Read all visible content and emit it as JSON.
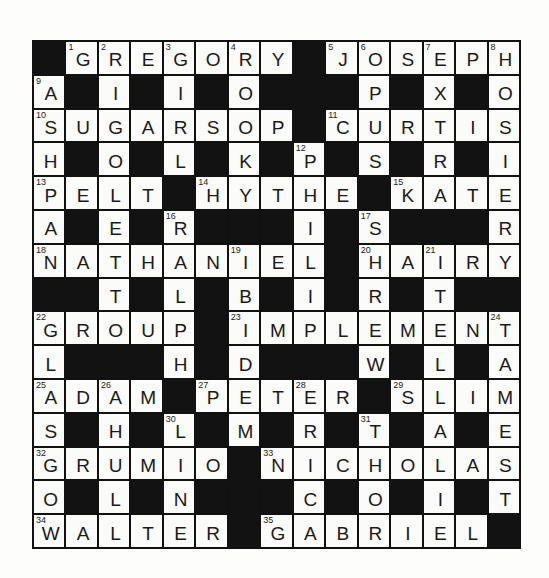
{
  "puzzle": {
    "rows": 15,
    "cols": 15,
    "colors": {
      "block": "#121212",
      "cell": "#fbfbf9",
      "line": "#111111",
      "text": "#1a1a1a"
    },
    "grid": [
      [
        "#",
        "G",
        "R",
        "E",
        "G",
        "O",
        "R",
        "Y",
        "#",
        "J",
        "O",
        "S",
        "E",
        "P",
        "H"
      ],
      [
        "A",
        "#",
        "I",
        "#",
        "I",
        "#",
        "O",
        "#",
        "#",
        "#",
        "P",
        "#",
        "X",
        "#",
        "O"
      ],
      [
        "S",
        "U",
        "G",
        "A",
        "R",
        "S",
        "O",
        "P",
        "#",
        "C",
        "U",
        "R",
        "T",
        "I",
        "S"
      ],
      [
        "H",
        "#",
        "O",
        "#",
        "L",
        "#",
        "K",
        "#",
        "P",
        "#",
        "S",
        "#",
        "R",
        "#",
        "I"
      ],
      [
        "P",
        "E",
        "L",
        "T",
        "#",
        "H",
        "Y",
        "T",
        "H",
        "E",
        "#",
        "K",
        "A",
        "T",
        "E"
      ],
      [
        "A",
        "#",
        "E",
        "#",
        "R",
        "#",
        "#",
        "#",
        "I",
        "#",
        "S",
        "#",
        "#",
        "#",
        "R"
      ],
      [
        "N",
        "A",
        "T",
        "H",
        "A",
        "N",
        "I",
        "E",
        "L",
        "#",
        "H",
        "A",
        "I",
        "R",
        "Y"
      ],
      [
        "#",
        "#",
        "T",
        "#",
        "L",
        "#",
        "B",
        "#",
        "I",
        "#",
        "R",
        "#",
        "T",
        "#",
        "#"
      ],
      [
        "G",
        "R",
        "O",
        "U",
        "P",
        "#",
        "I",
        "M",
        "P",
        "L",
        "E",
        "M",
        "E",
        "N",
        "T"
      ],
      [
        "L",
        "#",
        "#",
        "#",
        "H",
        "#",
        "D",
        "#",
        "#",
        "#",
        "W",
        "#",
        "L",
        "#",
        "A"
      ],
      [
        "A",
        "D",
        "A",
        "M",
        "#",
        "P",
        "E",
        "T",
        "E",
        "R",
        "#",
        "S",
        "L",
        "I",
        "M"
      ],
      [
        "S",
        "#",
        "H",
        "#",
        "L",
        "#",
        "M",
        "#",
        "R",
        "#",
        "T",
        "#",
        "A",
        "#",
        "E"
      ],
      [
        "G",
        "R",
        "U",
        "M",
        "I",
        "O",
        "#",
        "N",
        "I",
        "C",
        "H",
        "O",
        "L",
        "A",
        "S"
      ],
      [
        "O",
        "#",
        "L",
        "#",
        "N",
        "#",
        "#",
        "#",
        "C",
        "#",
        "O",
        "#",
        "I",
        "#",
        "T"
      ],
      [
        "W",
        "A",
        "L",
        "T",
        "E",
        "R",
        "#",
        "G",
        "A",
        "B",
        "R",
        "I",
        "E",
        "L",
        "#"
      ]
    ],
    "numbers": [
      {
        "n": 1,
        "r": 0,
        "c": 1
      },
      {
        "n": 2,
        "r": 0,
        "c": 2
      },
      {
        "n": 3,
        "r": 0,
        "c": 4
      },
      {
        "n": 4,
        "r": 0,
        "c": 6
      },
      {
        "n": 5,
        "r": 0,
        "c": 9
      },
      {
        "n": 6,
        "r": 0,
        "c": 10
      },
      {
        "n": 7,
        "r": 0,
        "c": 12
      },
      {
        "n": 8,
        "r": 0,
        "c": 14
      },
      {
        "n": 9,
        "r": 1,
        "c": 0
      },
      {
        "n": 10,
        "r": 2,
        "c": 0
      },
      {
        "n": 11,
        "r": 2,
        "c": 9
      },
      {
        "n": 12,
        "r": 3,
        "c": 8
      },
      {
        "n": 13,
        "r": 4,
        "c": 0
      },
      {
        "n": 14,
        "r": 4,
        "c": 5
      },
      {
        "n": 15,
        "r": 4,
        "c": 11
      },
      {
        "n": 16,
        "r": 5,
        "c": 4
      },
      {
        "n": 17,
        "r": 5,
        "c": 10
      },
      {
        "n": 18,
        "r": 6,
        "c": 0
      },
      {
        "n": 19,
        "r": 6,
        "c": 6
      },
      {
        "n": 20,
        "r": 6,
        "c": 10
      },
      {
        "n": 21,
        "r": 6,
        "c": 12
      },
      {
        "n": 22,
        "r": 8,
        "c": 0
      },
      {
        "n": 23,
        "r": 8,
        "c": 6
      },
      {
        "n": 24,
        "r": 8,
        "c": 14
      },
      {
        "n": 25,
        "r": 10,
        "c": 0
      },
      {
        "n": 26,
        "r": 10,
        "c": 2
      },
      {
        "n": 27,
        "r": 10,
        "c": 5
      },
      {
        "n": 28,
        "r": 10,
        "c": 8
      },
      {
        "n": 29,
        "r": 10,
        "c": 11
      },
      {
        "n": 30,
        "r": 11,
        "c": 4
      },
      {
        "n": 31,
        "r": 11,
        "c": 10
      },
      {
        "n": 32,
        "r": 12,
        "c": 0
      },
      {
        "n": 33,
        "r": 12,
        "c": 7
      },
      {
        "n": 34,
        "r": 14,
        "c": 0
      },
      {
        "n": 35,
        "r": 14,
        "c": 7
      }
    ],
    "entries": {
      "across": [
        {
          "n": 1,
          "answer": "GREGORY"
        },
        {
          "n": 5,
          "answer": "JOSEPH"
        },
        {
          "n": 10,
          "answer": "SUGARSOP"
        },
        {
          "n": 11,
          "answer": "CURTIS"
        },
        {
          "n": 13,
          "answer": "PELT"
        },
        {
          "n": 14,
          "answer": "HYTHE"
        },
        {
          "n": 15,
          "answer": "KATE"
        },
        {
          "n": 18,
          "answer": "NATHANIEL"
        },
        {
          "n": 20,
          "answer": "HAIRY"
        },
        {
          "n": 22,
          "answer": "GROUP"
        },
        {
          "n": 23,
          "answer": "IMPLEMENT"
        },
        {
          "n": 25,
          "answer": "ADAM"
        },
        {
          "n": 27,
          "answer": "PETER"
        },
        {
          "n": 29,
          "answer": "SLIM"
        },
        {
          "n": 32,
          "answer": "GRUMIO"
        },
        {
          "n": 33,
          "answer": "NICHOLAS"
        },
        {
          "n": 34,
          "answer": "WALTER"
        },
        {
          "n": 35,
          "answer": "GABRIEL"
        }
      ],
      "down": [
        {
          "n": 2,
          "answer": "RIGOLETTO"
        },
        {
          "n": 3,
          "answer": "GIRL"
        },
        {
          "n": 4,
          "answer": "ROOK"
        },
        {
          "n": 6,
          "answer": "OPUS"
        },
        {
          "n": 7,
          "answer": "EXTRA"
        },
        {
          "n": 8,
          "answer": "HOISTER"
        },
        {
          "n": 9,
          "answer": "ASHPAN"
        },
        {
          "n": 12,
          "answer": "PHILIP"
        },
        {
          "n": 16,
          "answer": "RALPH"
        },
        {
          "n": 17,
          "answer": "SHREW"
        },
        {
          "n": 19,
          "answer": "IBIDEM"
        },
        {
          "n": 21,
          "answer": "ITEL"
        },
        {
          "n": 22,
          "answer": "GLASGOW"
        },
        {
          "n": 24,
          "answer": "TAMEST"
        },
        {
          "n": 26,
          "answer": "AHUL"
        },
        {
          "n": 28,
          "answer": "ERIC"
        },
        {
          "n": 30,
          "answer": "LINE"
        },
        {
          "n": 31,
          "answer": "THOR"
        }
      ]
    }
  }
}
